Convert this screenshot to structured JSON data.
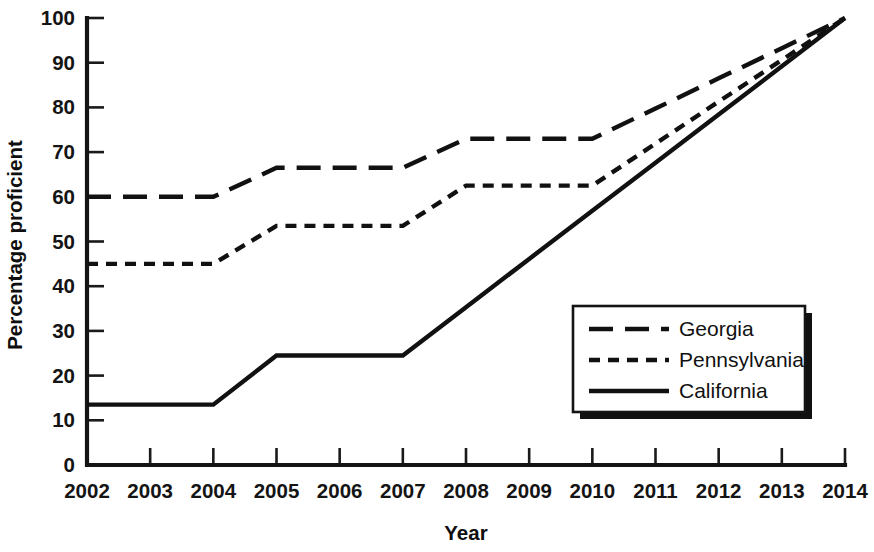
{
  "chart_data": {
    "type": "line",
    "title": "",
    "xlabel": "Year",
    "ylabel": "Percentage proficient",
    "x": [
      2002,
      2003,
      2004,
      2005,
      2006,
      2007,
      2008,
      2009,
      2010,
      2011,
      2012,
      2013,
      2014
    ],
    "xtick_labels": [
      "2002",
      "2003",
      "2004",
      "2005",
      "2006",
      "2007",
      "2008",
      "2009",
      "2010",
      "2011",
      "2012",
      "2013",
      "2014"
    ],
    "ytick_labels": [
      "0",
      "10",
      "20",
      "30",
      "40",
      "50",
      "60",
      "70",
      "80",
      "90",
      "100"
    ],
    "yticks": [
      0,
      10,
      20,
      30,
      40,
      50,
      60,
      70,
      80,
      90,
      100
    ],
    "xlim": [
      2002,
      2014
    ],
    "ylim": [
      0,
      100
    ],
    "grid": false,
    "legend_position": "lower right",
    "series": [
      {
        "name": "Georgia",
        "dash": "long-dash",
        "values": [
          60,
          60,
          60,
          66.5,
          66.5,
          66.5,
          73,
          73,
          73,
          79.75,
          86.5,
          93.25,
          100
        ]
      },
      {
        "name": "Pennsylvania",
        "dash": "short-dash",
        "values": [
          45,
          45,
          45,
          53.5,
          53.5,
          53.5,
          62.5,
          62.5,
          62.5,
          71.9,
          81.3,
          90.6,
          100
        ]
      },
      {
        "name": "California",
        "dash": "solid",
        "values": [
          13.5,
          13.5,
          13.5,
          24.5,
          24.5,
          24.5,
          35.3,
          46.1,
          56.9,
          67.6,
          78.4,
          89.2,
          100
        ]
      }
    ]
  },
  "legend": {
    "items": [
      {
        "label": "Georgia",
        "dash": "long-dash"
      },
      {
        "label": "Pennsylvania",
        "dash": "short-dash"
      },
      {
        "label": "California",
        "dash": "solid"
      }
    ]
  },
  "colors": {
    "line": "#111111",
    "axis": "#141414",
    "background": "#ffffff"
  }
}
